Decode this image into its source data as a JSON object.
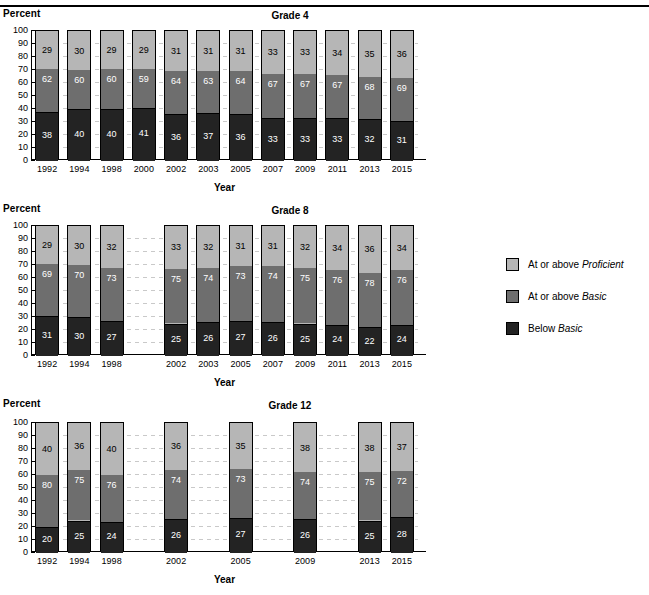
{
  "figure": {
    "y_axis_title": "Percent",
    "x_axis_title": "Year",
    "y_ticks": [
      "100",
      "90",
      "80",
      "70",
      "60",
      "50",
      "40",
      "30",
      "20",
      "10",
      "0"
    ]
  },
  "legend": {
    "items": [
      {
        "label_plain": "At or above ",
        "label_italic": "Proficient",
        "color": "#b6b6b6",
        "name": "at-or-above-proficient"
      },
      {
        "label_plain": "At or above ",
        "label_italic": "Basic",
        "color": "#6e6e6e",
        "name": "at-or-above-basic"
      },
      {
        "label_plain": "Below ",
        "label_italic": "Basic",
        "color": "#232323",
        "name": "below-basic"
      }
    ]
  },
  "colors": {
    "proficient": "#b6b6b6",
    "basic": "#6e6e6e",
    "below_basic": "#232323",
    "axis": "#000000",
    "gridline": "#c9c9c9"
  },
  "chart_data": [
    {
      "type": "bar",
      "title": "Grade 4",
      "xlabel": "Year",
      "ylabel": "Percent",
      "ylim": [
        0,
        100
      ],
      "grid": true,
      "legend_position": "right",
      "stacked": true,
      "categories": [
        "1992",
        "1994",
        "1998",
        "2000",
        "2002",
        "2003",
        "2005",
        "2007",
        "2009",
        "2011",
        "2013",
        "2015"
      ],
      "series": [
        {
          "name": "Below Basic",
          "values": [
            38,
            40,
            40,
            41,
            36,
            37,
            36,
            33,
            33,
            33,
            32,
            31
          ]
        },
        {
          "name": "At or above Basic",
          "values": [
            62,
            60,
            60,
            59,
            64,
            63,
            64,
            67,
            67,
            67,
            68,
            69
          ]
        },
        {
          "name": "At or above Proficient",
          "values": [
            29,
            30,
            29,
            29,
            31,
            31,
            31,
            33,
            33,
            34,
            35,
            36
          ]
        }
      ]
    },
    {
      "type": "bar",
      "title": "Grade 8",
      "xlabel": "Year",
      "ylabel": "Percent",
      "ylim": [
        0,
        100
      ],
      "grid": true,
      "legend_position": "right",
      "stacked": true,
      "categories": [
        "1992",
        "1994",
        "1998",
        "2000",
        "2002",
        "2003",
        "2005",
        "2007",
        "2009",
        "2011",
        "2013",
        "2015"
      ],
      "series": [
        {
          "name": "Below Basic",
          "values": [
            31,
            30,
            27,
            null,
            25,
            26,
            27,
            26,
            25,
            24,
            22,
            24
          ]
        },
        {
          "name": "At or above Basic",
          "values": [
            69,
            70,
            73,
            null,
            75,
            74,
            73,
            74,
            75,
            76,
            78,
            76
          ]
        },
        {
          "name": "At or above Proficient",
          "values": [
            29,
            30,
            32,
            null,
            33,
            32,
            31,
            31,
            32,
            34,
            36,
            34
          ]
        }
      ]
    },
    {
      "type": "bar",
      "title": "Grade 12",
      "xlabel": "Year",
      "ylabel": "Percent",
      "ylim": [
        0,
        100
      ],
      "grid": true,
      "legend_position": "right",
      "stacked": true,
      "categories": [
        "1992",
        "1994",
        "1998",
        "2000",
        "2002",
        "2003",
        "2005",
        "2007",
        "2009",
        "2011",
        "2013",
        "2015"
      ],
      "series": [
        {
          "name": "Below Basic",
          "values": [
            20,
            25,
            24,
            null,
            26,
            null,
            27,
            null,
            26,
            null,
            25,
            28
          ]
        },
        {
          "name": "At or above Basic",
          "values": [
            80,
            75,
            76,
            null,
            74,
            null,
            73,
            null,
            74,
            null,
            75,
            72
          ]
        },
        {
          "name": "At or above Proficient",
          "values": [
            40,
            36,
            40,
            null,
            36,
            null,
            35,
            null,
            38,
            null,
            38,
            37
          ]
        }
      ]
    }
  ]
}
